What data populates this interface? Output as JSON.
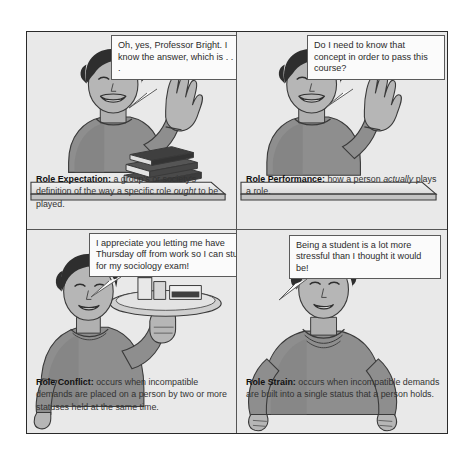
{
  "figure": {
    "panels": [
      {
        "id": "role-expectation",
        "term": "Role Expectation:",
        "definition_before_italic": " a group's or society's definition of the way a specific role ",
        "italic_word": "ought",
        "definition_after_italic": " to be played.",
        "speech": "Oh, yes, Professor Bright. I know the answer, which is . . .",
        "scene": "student-raising-hand-at-desk-with-books"
      },
      {
        "id": "role-performance",
        "term": "Role Performance:",
        "definition_before_italic": " how a person ",
        "italic_word": "actually",
        "definition_after_italic": " plays a role.",
        "speech": "Do I need to know that concept in order to pass this course?",
        "scene": "student-raising-hand-at-empty-desk"
      },
      {
        "id": "role-conflict",
        "term": "Role Conflict:",
        "definition_before_italic": " occurs when incompatible demands are placed on a person by two or more statuses held at the same time.",
        "italic_word": "",
        "definition_after_italic": "",
        "speech": "I appreciate you letting me have Thursday off from work so I can study for my sociology exam!",
        "scene": "waitress-holding-serving-tray"
      },
      {
        "id": "role-strain",
        "term": "Role Strain:",
        "definition_before_italic": " occurs when incompatible demands are built into a single status that a person holds.",
        "italic_word": "",
        "definition_after_italic": "",
        "speech": "Being a student is a lot more stressful than I thought it would be!",
        "scene": "woman-with-hands-on-hips"
      }
    ]
  },
  "colors": {
    "page_background": "#ffffff",
    "panel_background": "#e9e9e9",
    "frame_border": "#2a2a2a",
    "divider": "#555555",
    "bubble_fill": "#fbfbfb",
    "bubble_border": "#5a5a5a",
    "sweater_gray": "#8e8e8e",
    "skin_gray": "#b6b6b6",
    "hair_dark": "#2e2e2e",
    "text_body": "#333333",
    "text_term": "#111111"
  }
}
